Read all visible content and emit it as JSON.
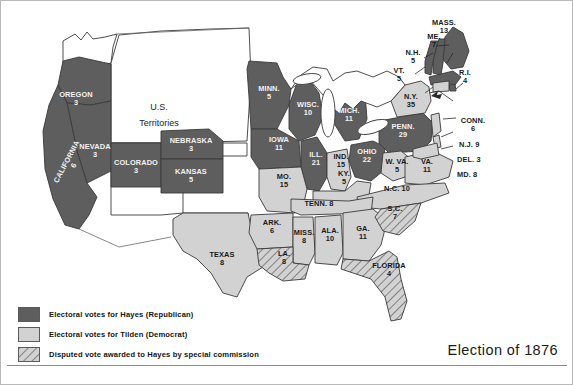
{
  "map": {
    "title": "Election of 1876",
    "territories_label": "U.S.\nTerritories",
    "territories_line1": "U.S.",
    "territories_line2": "Territories",
    "colors": {
      "hayes": "#5e5e5e",
      "tilden": "#d2d2d2",
      "disputed_hatch": "#d2d2d2",
      "outline": "#3a3a3a",
      "background": "#ffffff",
      "lake": "#ffffff"
    }
  },
  "legend": {
    "items": [
      {
        "swatch": "hayes",
        "label": "Electoral votes for Hayes (Republican)"
      },
      {
        "swatch": "tilden",
        "label": "Electoral votes for Tilden (Democrat)"
      },
      {
        "swatch": "disputed",
        "label": "Disputed vote awarded to Hayes by special commission"
      }
    ]
  },
  "states": [
    {
      "id": "oregon",
      "name": "OREGON",
      "votes": "3",
      "party": "hayes"
    },
    {
      "id": "nevada",
      "name": "NEVADA",
      "votes": "3",
      "party": "hayes"
    },
    {
      "id": "california",
      "name": "CALIFORNIA",
      "votes": "6",
      "party": "hayes"
    },
    {
      "id": "colorado",
      "name": "COLORADO",
      "votes": "3",
      "party": "hayes"
    },
    {
      "id": "nebraska",
      "name": "NEBRASKA",
      "votes": "3",
      "party": "hayes"
    },
    {
      "id": "kansas",
      "name": "KANSAS",
      "votes": "5",
      "party": "hayes"
    },
    {
      "id": "minnesota",
      "name": "MINN.",
      "votes": "5",
      "party": "hayes"
    },
    {
      "id": "wisconsin",
      "name": "WISC.",
      "votes": "10",
      "party": "hayes"
    },
    {
      "id": "iowa",
      "name": "IOWA",
      "votes": "11",
      "party": "hayes"
    },
    {
      "id": "illinois",
      "name": "ILL.",
      "votes": "21",
      "party": "hayes"
    },
    {
      "id": "michigan",
      "name": "MICH.",
      "votes": "11",
      "party": "hayes"
    },
    {
      "id": "indiana",
      "name": "IND.",
      "votes": "15",
      "party": "tilden"
    },
    {
      "id": "ohio",
      "name": "OHIO",
      "votes": "22",
      "party": "hayes"
    },
    {
      "id": "missouri",
      "name": "MO.",
      "votes": "15",
      "party": "tilden"
    },
    {
      "id": "pennsylvania",
      "name": "PENN.",
      "votes": "29",
      "party": "hayes"
    },
    {
      "id": "newyork",
      "name": "N.Y.",
      "votes": "35",
      "party": "tilden"
    },
    {
      "id": "maine",
      "name": "ME.",
      "votes": "7",
      "party": "hayes"
    },
    {
      "id": "newhampshire",
      "name": "N.H.",
      "votes": "5",
      "party": "hayes"
    },
    {
      "id": "vermont",
      "name": "VT.",
      "votes": "5",
      "party": "hayes"
    },
    {
      "id": "massachusetts",
      "name": "MASS.",
      "votes": "13",
      "party": "hayes"
    },
    {
      "id": "rhodeisland",
      "name": "R.I.",
      "votes": "4",
      "party": "hayes"
    },
    {
      "id": "connecticut",
      "name": "CONN.",
      "votes": "6",
      "party": "tilden"
    },
    {
      "id": "newjersey",
      "name": "N.J.",
      "votes": "9",
      "party": "tilden"
    },
    {
      "id": "delaware",
      "name": "DEL.",
      "votes": "3",
      "party": "tilden"
    },
    {
      "id": "maryland",
      "name": "MD.",
      "votes": "8",
      "party": "tilden"
    },
    {
      "id": "westvirginia",
      "name": "W. VA.",
      "votes": "5",
      "party": "tilden"
    },
    {
      "id": "virginia",
      "name": "VA.",
      "votes": "11",
      "party": "tilden"
    },
    {
      "id": "kentucky",
      "name": "KY.",
      "votes": "5",
      "party": "tilden"
    },
    {
      "id": "northcarolina",
      "name": "N.C.",
      "votes": "10",
      "party": "tilden"
    },
    {
      "id": "tennessee",
      "name": "TENN.",
      "votes": "8",
      "party": "tilden"
    },
    {
      "id": "arkansas",
      "name": "ARK.",
      "votes": "6",
      "party": "tilden"
    },
    {
      "id": "mississippi",
      "name": "MISS.",
      "votes": "8",
      "party": "tilden"
    },
    {
      "id": "alabama",
      "name": "ALA.",
      "votes": "10",
      "party": "tilden"
    },
    {
      "id": "georgia",
      "name": "GA.",
      "votes": "11",
      "party": "tilden"
    },
    {
      "id": "texas",
      "name": "TEXAS",
      "votes": "8",
      "party": "tilden"
    },
    {
      "id": "southcarolina",
      "name": "S.C.",
      "votes": "7",
      "party": "disputed"
    },
    {
      "id": "louisiana",
      "name": "LA.",
      "votes": "8",
      "party": "disputed"
    },
    {
      "id": "florida",
      "name": "FLORIDA",
      "votes": "4",
      "party": "disputed"
    }
  ]
}
